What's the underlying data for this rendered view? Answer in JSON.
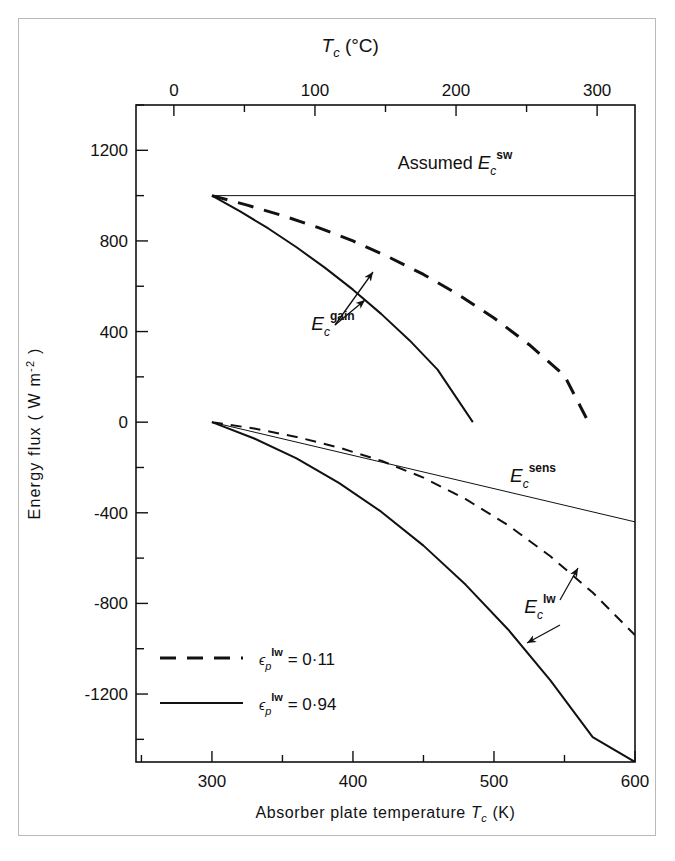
{
  "figure": {
    "background_color": "#ffffff",
    "frame_color": "#b9b9b9",
    "ink_color": "#111111"
  },
  "axes": {
    "top": {
      "title": "T",
      "title_sub": "c",
      "title_unit": "(°C)",
      "title_full": "T_c (°C)",
      "tick_labels": [
        "0",
        "100",
        "200",
        "300"
      ],
      "tick_values": [
        0,
        100,
        200,
        300
      ],
      "minor_step": 50,
      "range": [
        -26.85,
        326.85
      ]
    },
    "bottom": {
      "title": "Absorber plate temperature",
      "title_sym": "T",
      "title_sub": "c",
      "title_unit": "(K)",
      "title_full": "Absorber plate temperature T_c (K)",
      "tick_labels": [
        "300",
        "400",
        "500",
        "600"
      ],
      "tick_values": [
        300,
        400,
        500,
        600
      ],
      "minor_step": 50,
      "range": [
        246.15,
        600
      ]
    },
    "left": {
      "title": "Energy flux",
      "title_unit": "( W m",
      "title_exp": "-2",
      "title_close": " )",
      "title_full": "Energy flux ( W m-2 )",
      "tick_labels": [
        "1200",
        "800",
        "400",
        "0",
        "-400",
        "-800",
        "-1200"
      ],
      "tick_values": [
        1200,
        800,
        400,
        0,
        -400,
        -800,
        -1200
      ],
      "minor_step": 200,
      "range": [
        -1500,
        1400
      ]
    }
  },
  "annotations": [
    {
      "id": "assumed-sw",
      "sym": "E",
      "sub": "c",
      "sup": "sw",
      "prefix": "Assumed ",
      "text": "Assumed E_c^sw",
      "x": 455,
      "y": 169
    },
    {
      "id": "gain",
      "sym": "E",
      "sub": "c",
      "sup": "gain",
      "prefix": "",
      "text": "E_c^gain",
      "x": 333,
      "y": 330
    },
    {
      "id": "sens",
      "sym": "E",
      "sub": "c",
      "sup": "sens",
      "prefix": "",
      "text": "E_c^sens",
      "x": 533,
      "y": 482
    },
    {
      "id": "lw",
      "sym": "E",
      "sub": "c",
      "sup": "lw",
      "prefix": "",
      "text": "E_c^lw",
      "x": 540,
      "y": 613
    }
  ],
  "legend": {
    "entries": [
      {
        "style": "dashed",
        "sym": "ϵ",
        "sub": "p",
        "sup": "lw",
        "eq": " = 0·11",
        "text": "ϵ_p^lw = 0·11",
        "value": 0.11
      },
      {
        "style": "solid",
        "sym": "ϵ",
        "sub": "p",
        "sup": "lw",
        "eq": " = 0·94",
        "text": "ϵ_p^lw = 0·94",
        "value": 0.94
      }
    ]
  },
  "chart_data": {
    "type": "line",
    "title": "",
    "xlabel": "Absorber plate temperature T_c (K)",
    "ylabel": "Energy flux ( W m-2 )",
    "xlim": [
      246.15,
      600
    ],
    "ylim": [
      -1500,
      1400
    ],
    "x2lim": [
      -26.85,
      326.85
    ],
    "x2label": "T_c (°C)",
    "grid": false,
    "legend_position": "lower-left",
    "series": [
      {
        "name": "Assumed E_c^sw",
        "style": "solid",
        "width": 1,
        "label": "Assumed E_c^sw",
        "x": [
          300,
          600
        ],
        "y": [
          1000,
          1000
        ]
      },
      {
        "name": "E_c^gain (eps_p^lw = 0.11)",
        "style": "dashed",
        "width": 3,
        "label": "E_c^gain",
        "x": [
          300,
          325,
          350,
          375,
          400,
          425,
          450,
          475,
          500,
          525,
          550,
          567
        ],
        "y": [
          1000,
          958,
          912,
          860,
          800,
          730,
          652,
          562,
          460,
          342,
          205,
          0
        ]
      },
      {
        "name": "E_c^gain (eps_p^lw = 0.94)",
        "style": "solid",
        "width": 2,
        "label": "E_c^gain",
        "x": [
          300,
          320,
          340,
          360,
          380,
          400,
          420,
          440,
          460,
          485
        ],
        "y": [
          1000,
          930,
          855,
          772,
          682,
          585,
          478,
          362,
          232,
          0
        ]
      },
      {
        "name": "E_c^sens",
        "style": "solid",
        "width": 1,
        "label": "E_c^sens",
        "x": [
          300,
          600
        ],
        "y": [
          0,
          -440
        ]
      },
      {
        "name": "E_c^lw (eps_p^lw = 0.11)",
        "style": "dashed",
        "width": 2,
        "label": "E_c^lw",
        "x": [
          300,
          330,
          360,
          390,
          420,
          450,
          480,
          510,
          540,
          570,
          600
        ],
        "y": [
          0,
          -28,
          -65,
          -112,
          -170,
          -245,
          -340,
          -455,
          -592,
          -752,
          -940
        ]
      },
      {
        "name": "E_c^lw (eps_p^lw = 0.94)",
        "style": "solid",
        "width": 2,
        "label": "E_c^lw",
        "x": [
          300,
          330,
          360,
          390,
          420,
          450,
          480,
          510,
          540,
          570,
          600
        ],
        "y": [
          0,
          -72,
          -160,
          -268,
          -395,
          -545,
          -718,
          -915,
          -1140,
          -1390,
          -1500
        ]
      }
    ],
    "arrows": [
      {
        "from": [
          335,
          325
        ],
        "to": [
          373,
          272
        ],
        "target": "E_c^gain dashed"
      },
      {
        "from": [
          335,
          325
        ],
        "to": [
          365,
          300
        ],
        "target": "E_c^gain solid"
      },
      {
        "from": [
          560,
          600
        ],
        "to": [
          578,
          568
        ],
        "target": "E_c^lw dashed"
      },
      {
        "from": [
          560,
          625
        ],
        "to": [
          527,
          643
        ],
        "target": "E_c^lw solid"
      }
    ]
  }
}
